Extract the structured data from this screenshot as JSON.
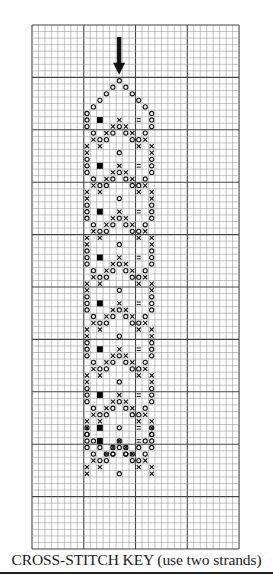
{
  "caption": "CROSS-STITCH KEY (use two strands)",
  "grid": {
    "x": 32,
    "y": 25,
    "cols": 32,
    "rows": 80,
    "cell_w": 6.47,
    "cell_h": 6.55,
    "major_every": 8,
    "minor_color": "#9a9a9a",
    "major_color": "#444444"
  },
  "arrow": {
    "col": 13,
    "top_y": 37,
    "tip_row": 7,
    "color": "#111111"
  },
  "symbol_legend": {
    "o": "circle stitch",
    "x": "cross stitch",
    "=": "equals stitch",
    "#": "filled square"
  },
  "pattern": {
    "origin_row": 8,
    "top": [
      [
        13,
        "o"
      ],
      [
        12,
        "o"
      ],
      [
        14,
        "o"
      ],
      [
        11,
        "o"
      ],
      [
        15,
        "o"
      ],
      [
        10,
        "o"
      ],
      [
        16,
        "o"
      ],
      [
        9,
        "o"
      ],
      [
        17,
        "o"
      ]
    ],
    "top_rows": [
      0,
      1,
      1,
      2,
      2,
      3,
      3,
      4,
      4
    ],
    "repeat": {
      "start_row": 5,
      "height": 7,
      "count": 8,
      "cells": [
        [
          0,
          8,
          "o"
        ],
        [
          0,
          18,
          "o"
        ],
        [
          1,
          8,
          "o"
        ],
        [
          1,
          10,
          "#"
        ],
        [
          1,
          13,
          "x"
        ],
        [
          1,
          16,
          "="
        ],
        [
          1,
          18,
          "o"
        ],
        [
          2,
          8,
          "o"
        ],
        [
          2,
          12,
          "x"
        ],
        [
          2,
          13,
          "o"
        ],
        [
          2,
          14,
          "x"
        ],
        [
          2,
          18,
          "o"
        ],
        [
          3,
          9,
          "o"
        ],
        [
          3,
          11,
          "x"
        ],
        [
          3,
          12,
          "o"
        ],
        [
          3,
          14,
          "o"
        ],
        [
          3,
          15,
          "x"
        ],
        [
          3,
          17,
          "o"
        ],
        [
          4,
          9,
          "x"
        ],
        [
          4,
          10,
          "o"
        ],
        [
          4,
          11,
          "o"
        ],
        [
          4,
          15,
          "o"
        ],
        [
          4,
          16,
          "o"
        ],
        [
          4,
          17,
          "x"
        ],
        [
          5,
          8,
          "x"
        ],
        [
          5,
          10,
          "x"
        ],
        [
          5,
          16,
          "x"
        ],
        [
          5,
          18,
          "x"
        ],
        [
          6,
          8,
          "x"
        ],
        [
          6,
          13,
          "o"
        ],
        [
          6,
          18,
          "x"
        ]
      ]
    },
    "bottom": {
      "start_row": 61,
      "cells": [
        [
          0,
          8,
          "o"
        ],
        [
          0,
          10,
          "#"
        ],
        [
          0,
          16,
          "="
        ],
        [
          0,
          18,
          "o"
        ],
        [
          1,
          8,
          "o"
        ],
        [
          1,
          18,
          "o"
        ],
        [
          2,
          9,
          "o"
        ],
        [
          2,
          13,
          "o"
        ],
        [
          2,
          17,
          "o"
        ],
        [
          3,
          10,
          "o"
        ],
        [
          3,
          12,
          "o"
        ],
        [
          3,
          14,
          "o"
        ],
        [
          3,
          16,
          "o"
        ],
        [
          4,
          11,
          "o"
        ],
        [
          4,
          12,
          "o"
        ],
        [
          4,
          14,
          "o"
        ],
        [
          4,
          15,
          "o"
        ]
      ]
    }
  }
}
